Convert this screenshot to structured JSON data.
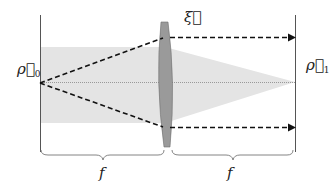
{
  "diagram": {
    "title": "",
    "labels": {
      "input_plane": "ρ⃗",
      "input_sub": "0",
      "output_plane": "ρ⃗",
      "output_sub": "1",
      "lens_plane": "ξ⃗",
      "focal_left": "f",
      "focal_right": "f"
    },
    "colors": {
      "beam_fill": "#e4e4e4",
      "lens_fill": "#9a9a9a",
      "ray": "#111111",
      "plane_line": "#555555",
      "axis": "#999999"
    }
  }
}
